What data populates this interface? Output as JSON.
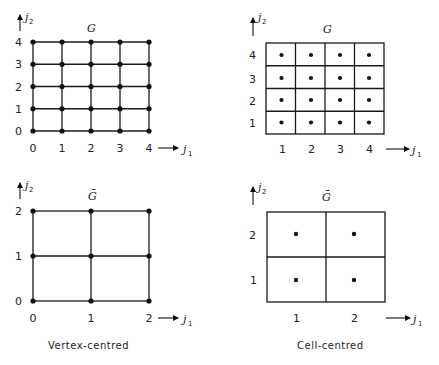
{
  "panels": {
    "vertex_fine": {
      "title": "G",
      "x_axis_label": "j",
      "x_axis_sub": "1",
      "y_axis_label": "j",
      "y_axis_sub": "2",
      "x_ticks": [
        "0",
        "1",
        "2",
        "3",
        "4"
      ],
      "y_ticks": [
        "0",
        "1",
        "2",
        "3",
        "4"
      ]
    },
    "cell_fine": {
      "title": "G",
      "x_axis_label": "j",
      "x_axis_sub": "1",
      "y_axis_label": "j",
      "y_axis_sub": "2",
      "x_ticks": [
        "1",
        "2",
        "3",
        "4"
      ],
      "y_ticks": [
        "1",
        "2",
        "3",
        "4"
      ]
    },
    "vertex_coarse": {
      "title": "Ḡ",
      "x_axis_label": "j",
      "x_axis_sub": "1",
      "y_axis_label": "j",
      "y_axis_sub": "2",
      "x_ticks": [
        "0",
        "1",
        "2"
      ],
      "y_ticks": [
        "0",
        "1",
        "2"
      ]
    },
    "cell_coarse": {
      "title": "Ḡ",
      "x_axis_label": "j",
      "x_axis_sub": "1",
      "y_axis_label": "j",
      "y_axis_sub": "2",
      "x_ticks": [
        "1",
        "2"
      ],
      "y_ticks": [
        "1",
        "2"
      ]
    }
  },
  "captions": {
    "left": "Vertex-centred",
    "right": "Cell-centred"
  }
}
